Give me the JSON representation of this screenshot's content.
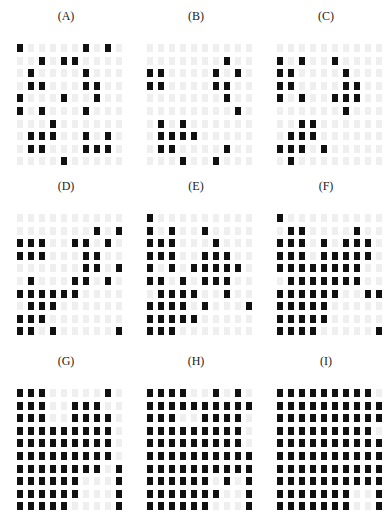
{
  "colors": {
    "on": "#111111",
    "off": "#efefef",
    "background": "#ffffff"
  },
  "panels": [
    {
      "label": "(A)",
      "grid": [
        [
          1,
          0,
          0,
          0,
          0,
          0,
          1,
          0,
          1,
          0
        ],
        [
          0,
          0,
          1,
          0,
          1,
          1,
          0,
          0,
          0,
          0
        ],
        [
          0,
          1,
          0,
          0,
          0,
          0,
          1,
          0,
          0,
          0
        ],
        [
          0,
          1,
          1,
          0,
          0,
          0,
          1,
          1,
          0,
          0
        ],
        [
          1,
          0,
          0,
          0,
          1,
          0,
          0,
          1,
          0,
          0
        ],
        [
          1,
          0,
          1,
          0,
          0,
          0,
          1,
          0,
          0,
          0
        ],
        [
          0,
          0,
          0,
          1,
          0,
          0,
          0,
          0,
          0,
          0
        ],
        [
          0,
          1,
          1,
          1,
          0,
          0,
          1,
          0,
          1,
          0
        ],
        [
          0,
          1,
          1,
          0,
          0,
          0,
          1,
          1,
          1,
          0
        ],
        [
          0,
          0,
          0,
          0,
          1,
          0,
          0,
          0,
          0,
          0
        ]
      ]
    },
    {
      "label": "(B)",
      "grid": [
        [
          0,
          0,
          0,
          0,
          0,
          0,
          0,
          0,
          0,
          0
        ],
        [
          0,
          0,
          0,
          0,
          0,
          0,
          0,
          1,
          0,
          0
        ],
        [
          1,
          1,
          0,
          0,
          0,
          0,
          1,
          0,
          1,
          0
        ],
        [
          1,
          1,
          0,
          0,
          0,
          0,
          1,
          1,
          0,
          0
        ],
        [
          0,
          0,
          0,
          0,
          0,
          0,
          0,
          1,
          0,
          0
        ],
        [
          0,
          0,
          0,
          0,
          0,
          0,
          0,
          0,
          1,
          0
        ],
        [
          0,
          1,
          0,
          1,
          0,
          0,
          0,
          0,
          0,
          0
        ],
        [
          0,
          1,
          1,
          1,
          1,
          0,
          0,
          0,
          0,
          0
        ],
        [
          0,
          1,
          1,
          0,
          0,
          0,
          0,
          1,
          0,
          0
        ],
        [
          0,
          0,
          0,
          1,
          0,
          0,
          1,
          0,
          0,
          0
        ]
      ]
    },
    {
      "label": "(C)",
      "grid": [
        [
          0,
          0,
          0,
          0,
          0,
          0,
          0,
          0,
          0,
          0
        ],
        [
          1,
          0,
          1,
          0,
          0,
          1,
          0,
          0,
          0,
          0
        ],
        [
          1,
          1,
          0,
          0,
          0,
          0,
          1,
          0,
          0,
          0
        ],
        [
          1,
          1,
          0,
          0,
          0,
          0,
          1,
          1,
          0,
          0
        ],
        [
          1,
          0,
          1,
          0,
          0,
          1,
          1,
          1,
          0,
          0
        ],
        [
          0,
          0,
          0,
          0,
          0,
          0,
          1,
          0,
          0,
          0
        ],
        [
          0,
          0,
          1,
          1,
          0,
          0,
          0,
          0,
          0,
          0
        ],
        [
          0,
          1,
          1,
          1,
          0,
          0,
          0,
          0,
          0,
          0
        ],
        [
          1,
          1,
          1,
          0,
          1,
          0,
          0,
          0,
          0,
          0
        ],
        [
          0,
          1,
          0,
          0,
          0,
          0,
          0,
          0,
          0,
          0
        ]
      ]
    },
    {
      "label": "(D)",
      "grid": [
        [
          0,
          0,
          0,
          0,
          0,
          0,
          0,
          0,
          0,
          0
        ],
        [
          0,
          0,
          0,
          0,
          0,
          0,
          0,
          1,
          0,
          1
        ],
        [
          1,
          1,
          1,
          0,
          0,
          1,
          1,
          0,
          1,
          0
        ],
        [
          1,
          1,
          1,
          0,
          0,
          0,
          1,
          1,
          0,
          0
        ],
        [
          0,
          0,
          0,
          0,
          0,
          0,
          1,
          1,
          0,
          1
        ],
        [
          0,
          1,
          0,
          0,
          0,
          1,
          1,
          0,
          1,
          0
        ],
        [
          1,
          1,
          1,
          1,
          1,
          1,
          0,
          0,
          0,
          0
        ],
        [
          0,
          1,
          1,
          1,
          0,
          0,
          0,
          0,
          0,
          0
        ],
        [
          1,
          1,
          1,
          0,
          0,
          0,
          0,
          0,
          0,
          0
        ],
        [
          1,
          1,
          0,
          1,
          0,
          0,
          0,
          0,
          0,
          1
        ]
      ]
    },
    {
      "label": "(E)",
      "grid": [
        [
          1,
          0,
          0,
          0,
          0,
          0,
          0,
          0,
          0,
          0
        ],
        [
          1,
          0,
          1,
          0,
          0,
          1,
          0,
          0,
          0,
          0
        ],
        [
          1,
          1,
          1,
          0,
          0,
          0,
          1,
          0,
          0,
          0
        ],
        [
          1,
          1,
          1,
          0,
          0,
          1,
          1,
          1,
          0,
          0
        ],
        [
          1,
          0,
          1,
          0,
          1,
          1,
          1,
          1,
          1,
          0
        ],
        [
          1,
          1,
          0,
          1,
          0,
          1,
          1,
          1,
          0,
          0
        ],
        [
          0,
          1,
          1,
          1,
          1,
          0,
          0,
          1,
          0,
          0
        ],
        [
          1,
          1,
          1,
          1,
          0,
          1,
          0,
          0,
          0,
          1
        ],
        [
          1,
          1,
          1,
          1,
          1,
          0,
          0,
          0,
          0,
          0
        ],
        [
          1,
          1,
          1,
          0,
          0,
          0,
          0,
          0,
          0,
          0
        ]
      ]
    },
    {
      "label": "(F)",
      "grid": [
        [
          1,
          0,
          0,
          0,
          0,
          0,
          0,
          0,
          0,
          0
        ],
        [
          0,
          1,
          1,
          0,
          0,
          0,
          0,
          1,
          0,
          0
        ],
        [
          1,
          1,
          1,
          0,
          1,
          0,
          1,
          1,
          1,
          0
        ],
        [
          1,
          1,
          1,
          0,
          1,
          1,
          1,
          1,
          1,
          0
        ],
        [
          1,
          1,
          1,
          1,
          1,
          1,
          1,
          1,
          0,
          0
        ],
        [
          0,
          1,
          1,
          1,
          1,
          1,
          1,
          1,
          0,
          0
        ],
        [
          1,
          1,
          1,
          1,
          1,
          1,
          0,
          0,
          1,
          1
        ],
        [
          1,
          1,
          1,
          1,
          1,
          0,
          0,
          0,
          0,
          0
        ],
        [
          1,
          1,
          1,
          1,
          1,
          0,
          0,
          0,
          0,
          0
        ],
        [
          1,
          1,
          1,
          1,
          0,
          0,
          0,
          0,
          0,
          1
        ]
      ]
    },
    {
      "label": "(G)",
      "grid": [
        [
          1,
          1,
          1,
          0,
          0,
          0,
          0,
          0,
          1,
          0
        ],
        [
          1,
          1,
          1,
          0,
          0,
          1,
          1,
          1,
          0,
          0
        ],
        [
          1,
          1,
          1,
          0,
          0,
          1,
          1,
          1,
          1,
          0
        ],
        [
          1,
          1,
          1,
          1,
          1,
          1,
          1,
          1,
          1,
          0
        ],
        [
          1,
          1,
          1,
          1,
          1,
          1,
          1,
          1,
          1,
          0
        ],
        [
          1,
          1,
          1,
          1,
          1,
          1,
          1,
          1,
          1,
          0
        ],
        [
          1,
          1,
          1,
          1,
          1,
          1,
          1,
          1,
          0,
          1
        ],
        [
          1,
          1,
          1,
          1,
          1,
          1,
          0,
          0,
          0,
          1
        ],
        [
          1,
          1,
          1,
          1,
          1,
          1,
          0,
          0,
          0,
          1
        ],
        [
          1,
          1,
          1,
          1,
          1,
          0,
          0,
          0,
          0,
          1
        ]
      ]
    },
    {
      "label": "(H)",
      "grid": [
        [
          1,
          1,
          1,
          1,
          0,
          0,
          1,
          0,
          1,
          0
        ],
        [
          1,
          1,
          1,
          1,
          1,
          1,
          1,
          1,
          1,
          1
        ],
        [
          1,
          1,
          1,
          0,
          0,
          1,
          1,
          1,
          1,
          0
        ],
        [
          1,
          1,
          1,
          1,
          1,
          1,
          1,
          1,
          1,
          0
        ],
        [
          1,
          1,
          1,
          1,
          1,
          1,
          1,
          1,
          1,
          0
        ],
        [
          1,
          1,
          1,
          1,
          1,
          1,
          1,
          1,
          1,
          1
        ],
        [
          1,
          1,
          1,
          1,
          1,
          1,
          1,
          1,
          1,
          1
        ],
        [
          1,
          1,
          1,
          1,
          1,
          1,
          0,
          1,
          0,
          1
        ],
        [
          1,
          1,
          1,
          1,
          1,
          1,
          1,
          0,
          0,
          1
        ],
        [
          1,
          1,
          1,
          1,
          1,
          1,
          0,
          0,
          0,
          1
        ]
      ]
    },
    {
      "label": "(I)",
      "grid": [
        [
          1,
          1,
          1,
          1,
          1,
          1,
          1,
          1,
          1,
          0
        ],
        [
          1,
          1,
          1,
          1,
          1,
          1,
          1,
          1,
          1,
          1
        ],
        [
          1,
          1,
          1,
          1,
          1,
          1,
          1,
          1,
          1,
          1
        ],
        [
          1,
          1,
          1,
          1,
          1,
          1,
          1,
          1,
          1,
          0
        ],
        [
          1,
          1,
          1,
          1,
          1,
          1,
          1,
          1,
          1,
          1
        ],
        [
          1,
          1,
          1,
          1,
          1,
          1,
          1,
          1,
          1,
          1
        ],
        [
          1,
          1,
          1,
          1,
          1,
          1,
          1,
          1,
          1,
          1
        ],
        [
          1,
          1,
          1,
          1,
          1,
          1,
          1,
          1,
          1,
          1
        ],
        [
          1,
          1,
          1,
          1,
          1,
          1,
          1,
          0,
          0,
          1
        ],
        [
          1,
          1,
          1,
          1,
          1,
          1,
          1,
          0,
          0,
          1
        ]
      ]
    }
  ]
}
